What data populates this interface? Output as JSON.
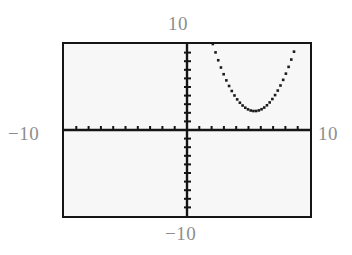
{
  "view": {
    "kind": "graphing-calculator-screen",
    "background_color": "#f7f7f7",
    "border_color": "#151515",
    "label_color": "#8e8e8e",
    "curve_color": "#1a1a1a"
  },
  "labels": {
    "top": "10",
    "left": "−10",
    "right": "10",
    "bottom": "−10"
  },
  "chart_data": {
    "type": "line",
    "title": "",
    "xlabel": "",
    "ylabel": "",
    "xlim": [
      -10,
      10
    ],
    "ylim": [
      -10,
      10
    ],
    "xtick_spacing": 1,
    "ytick_spacing": 1,
    "grid": false,
    "legend": false,
    "axes": {
      "x_axis_at_y": 0,
      "y_axis_at_x": 0,
      "tick_marks": true,
      "ticks_per_side_x": 10,
      "ticks_per_side_y": 10
    },
    "series": [
      {
        "name": "parabola",
        "style": "dotted-pixelated",
        "vertex": [
          5.5,
          2.2
        ],
        "x": [
          2.1,
          2.4,
          2.7,
          3.0,
          3.3,
          3.6,
          3.9,
          4.2,
          4.5,
          4.8,
          5.1,
          5.4,
          5.7,
          6.0,
          6.3,
          6.6,
          6.9,
          7.2,
          7.5,
          7.8,
          8.1,
          8.4,
          8.7,
          9.0,
          9.3,
          9.6,
          9.8
        ],
        "y": [
          10.0,
          8.8,
          7.7,
          6.7,
          5.8,
          5.0,
          4.3,
          3.7,
          3.2,
          2.7,
          2.4,
          2.2,
          2.2,
          2.3,
          2.5,
          2.8,
          3.2,
          3.7,
          4.3,
          5.0,
          5.8,
          6.7,
          7.7,
          8.8,
          10.0,
          10.0,
          10.0
        ]
      }
    ]
  }
}
